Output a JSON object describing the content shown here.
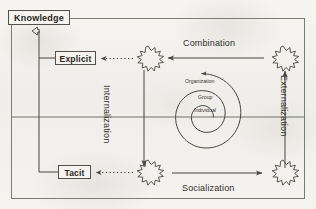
{
  "diagram": {
    "background_color": "#f2f1ee",
    "ink_color": "#4a4540",
    "frame": {
      "name": "outer-frame",
      "border_color": "#6f6a63"
    },
    "nodes": [
      {
        "id": "knowledge",
        "label": "Knowledge",
        "shape": "rectangle"
      },
      {
        "id": "explicit",
        "label": "Explicit",
        "shape": "rectangle"
      },
      {
        "id": "tacit",
        "label": "Tacit",
        "shape": "rectangle"
      }
    ],
    "flow_labels": [
      {
        "id": "combination",
        "label": "Combination",
        "orientation": "horizontal",
        "arrow_direction": "left"
      },
      {
        "id": "socialization",
        "label": "Socialization",
        "orientation": "horizontal",
        "arrow_direction": "right"
      },
      {
        "id": "internalization",
        "label": "Internalization",
        "orientation": "vertical",
        "arrow_direction": "down"
      },
      {
        "id": "externalization",
        "label": "Externalization",
        "orientation": "vertical",
        "arrow_direction": "up"
      }
    ],
    "spiral": {
      "name": "knowledge-spiral",
      "direction": "counterclockwise-outward",
      "levels": [
        {
          "id": "individual",
          "label": "Individual"
        },
        {
          "id": "group",
          "label": "Group"
        },
        {
          "id": "organization",
          "label": "Organization"
        }
      ]
    },
    "bursts": [
      {
        "id": "burst-top-left",
        "name": "starburst-explicit"
      },
      {
        "id": "burst-top-right",
        "name": "starburst-combination-source"
      },
      {
        "id": "burst-bottom-left",
        "name": "starburst-tacit"
      },
      {
        "id": "burst-bottom-right",
        "name": "starburst-socialization-target"
      }
    ],
    "connectors": [
      {
        "id": "knowledge-trunk",
        "style": "solid",
        "arrow": "hollow-up"
      },
      {
        "id": "explicit-branch",
        "style": "solid",
        "arrow": "none"
      },
      {
        "id": "tacit-branch",
        "style": "solid",
        "arrow": "none"
      },
      {
        "id": "explicit-dotted",
        "style": "dotted",
        "arrow": "left"
      },
      {
        "id": "tacit-dotted",
        "style": "dotted",
        "arrow": "left"
      },
      {
        "id": "axis-horizontal",
        "style": "solid",
        "arrow": "none"
      }
    ]
  }
}
